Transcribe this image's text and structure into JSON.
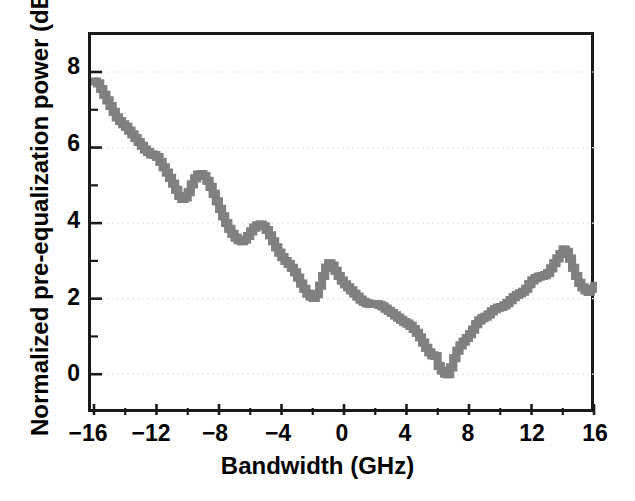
{
  "chart_data": {
    "type": "line",
    "title": "",
    "xlabel": "Bandwidth (GHz)",
    "ylabel": "Normalized pre-equalization power (dB)",
    "xlim": [
      -16,
      16
    ],
    "ylim": [
      -1.0,
      8.9
    ],
    "grid": true,
    "grid_axis": "y",
    "legend": "none",
    "series_color": "#808080",
    "axis_color": "#1a1a1a",
    "grid_color": "#e8e8e8",
    "xticks": [
      -16,
      -12,
      -8,
      -4,
      0,
      4,
      8,
      12,
      16
    ],
    "xtick_labels": [
      "−16",
      "−12",
      "−8",
      "−4",
      "0",
      "4",
      "8",
      "12",
      "16"
    ],
    "xminor_ticks": [
      -14,
      -10,
      -6,
      -2,
      2,
      6,
      10,
      14
    ],
    "yticks": [
      0,
      2,
      4,
      6,
      8
    ],
    "ytick_labels": [
      "0",
      "2",
      "4",
      "6",
      "8"
    ],
    "yminor_ticks": [
      1,
      3,
      5,
      7
    ],
    "series": [
      {
        "name": "Normalized pre-equalization power",
        "x": [
          -16.0,
          -15.8,
          -15.6,
          -15.4,
          -15.2,
          -15.0,
          -14.8,
          -14.6,
          -14.4,
          -14.2,
          -14.0,
          -13.8,
          -13.6,
          -13.4,
          -13.2,
          -13.0,
          -12.8,
          -12.6,
          -12.4,
          -12.2,
          -12.0,
          -11.8,
          -11.6,
          -11.4,
          -11.2,
          -11.0,
          -10.8,
          -10.6,
          -10.4,
          -10.2,
          -10.0,
          -9.8,
          -9.6,
          -9.4,
          -9.2,
          -9.0,
          -8.8,
          -8.6,
          -8.4,
          -8.2,
          -8.0,
          -7.8,
          -7.6,
          -7.4,
          -7.2,
          -7.0,
          -6.8,
          -6.6,
          -6.4,
          -6.2,
          -6.0,
          -5.8,
          -5.6,
          -5.4,
          -5.2,
          -5.0,
          -4.8,
          -4.6,
          -4.4,
          -4.2,
          -4.0,
          -3.8,
          -3.6,
          -3.4,
          -3.2,
          -3.0,
          -2.8,
          -2.6,
          -2.4,
          -2.2,
          -2.0,
          -1.8,
          -1.6,
          -1.4,
          -1.2,
          -1.0,
          -0.8,
          -0.6,
          -0.4,
          -0.2,
          0.0,
          0.2,
          0.4,
          0.6,
          0.8,
          1.0,
          1.2,
          1.4,
          1.6,
          1.8,
          2.0,
          2.2,
          2.4,
          2.6,
          2.8,
          3.0,
          3.2,
          3.4,
          3.6,
          3.8,
          4.0,
          4.2,
          4.4,
          4.6,
          4.8,
          5.0,
          5.2,
          5.4,
          5.6,
          5.8,
          6.0,
          6.2,
          6.4,
          6.6,
          6.8,
          7.0,
          7.2,
          7.4,
          7.6,
          7.8,
          8.0,
          8.2,
          8.4,
          8.6,
          8.8,
          9.0,
          9.2,
          9.4,
          9.6,
          9.8,
          10.0,
          10.2,
          10.4,
          10.6,
          10.8,
          11.0,
          11.2,
          11.4,
          11.6,
          11.8,
          12.0,
          12.2,
          12.4,
          12.6,
          12.8,
          13.0,
          13.2,
          13.4,
          13.6,
          13.8,
          14.0,
          14.2,
          14.4,
          14.6,
          14.8,
          15.0,
          15.2,
          15.4,
          15.6,
          15.8,
          16.0
        ],
        "y": [
          7.75,
          7.7,
          7.55,
          7.4,
          7.25,
          7.1,
          6.95,
          6.8,
          6.7,
          6.62,
          6.55,
          6.45,
          6.35,
          6.25,
          6.15,
          6.05,
          5.95,
          5.88,
          5.82,
          5.8,
          5.75,
          5.62,
          5.48,
          5.34,
          5.2,
          5.05,
          4.88,
          4.72,
          4.64,
          4.68,
          4.82,
          5.02,
          5.18,
          5.28,
          5.3,
          5.25,
          5.12,
          4.96,
          4.78,
          4.58,
          4.38,
          4.18,
          4.0,
          3.85,
          3.72,
          3.62,
          3.55,
          3.52,
          3.56,
          3.66,
          3.78,
          3.88,
          3.94,
          3.96,
          3.92,
          3.82,
          3.68,
          3.52,
          3.36,
          3.22,
          3.1,
          3.0,
          2.92,
          2.82,
          2.7,
          2.56,
          2.4,
          2.26,
          2.14,
          2.06,
          2.02,
          2.12,
          2.34,
          2.6,
          2.82,
          2.94,
          2.88,
          2.74,
          2.6,
          2.48,
          2.38,
          2.3,
          2.22,
          2.14,
          2.06,
          1.98,
          1.92,
          1.88,
          1.86,
          1.86,
          1.86,
          1.84,
          1.8,
          1.74,
          1.68,
          1.62,
          1.56,
          1.5,
          1.44,
          1.38,
          1.34,
          1.28,
          1.2,
          1.1,
          0.98,
          0.84,
          0.7,
          0.58,
          0.5,
          0.48,
          0.22,
          0.1,
          0.02,
          0.0,
          0.18,
          0.42,
          0.62,
          0.76,
          0.86,
          0.96,
          1.06,
          1.18,
          1.32,
          1.42,
          1.48,
          1.52,
          1.58,
          1.66,
          1.72,
          1.76,
          1.78,
          1.82,
          1.88,
          1.96,
          2.04,
          2.1,
          2.14,
          2.18,
          2.26,
          2.38,
          2.48,
          2.54,
          2.58,
          2.6,
          2.62,
          2.68,
          2.8,
          2.94,
          3.06,
          3.18,
          3.3,
          3.24,
          3.06,
          2.82,
          2.6,
          2.42,
          2.3,
          2.22,
          2.18,
          2.26,
          2.34
        ]
      }
    ],
    "series_y_full": [
      7.75,
      7.7,
      7.55,
      7.4,
      7.25,
      7.1,
      6.95,
      6.8,
      6.7,
      6.62
    ]
  },
  "axes": {
    "x_title": "Bandwidth (GHz)",
    "y_title": "Normalized pre-equalization power (dB)"
  }
}
